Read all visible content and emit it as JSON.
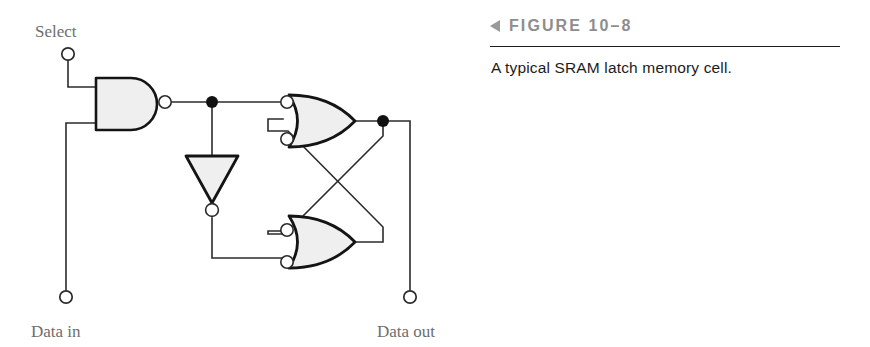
{
  "figure": {
    "marker_icon": "left-triangle-icon",
    "label": "FIGURE 10–8",
    "caption": "A typical SRAM latch memory cell."
  },
  "circuit": {
    "title": "A typical SRAM latch memory cell",
    "labels": {
      "select": "Select",
      "data_in": "Data in",
      "data_out": "Data out"
    },
    "colors": {
      "wire": "#2b2b2b",
      "gate_outline": "#141414",
      "gate_fill": "#efefef",
      "terminal_stroke": "#2b2b2b",
      "terminal_fill": "#ffffff",
      "junction_fill": "#111111",
      "label_text": "#6e6e6e",
      "caption_text": "#1c1c1c",
      "figure_label_text": "#8d8d8d",
      "rule": "#1d1d1d",
      "background": "#ffffff"
    },
    "terminals": [
      {
        "name": "select-terminal",
        "label": "Select",
        "x": 68,
        "y": 52
      },
      {
        "name": "data-in-terminal",
        "label": "Data in",
        "x": 66,
        "y": 298
      },
      {
        "name": "data-out-terminal",
        "label": "Data out",
        "x": 410,
        "y": 298
      }
    ],
    "gates": [
      {
        "name": "nand-gate",
        "type": "NAND",
        "inputs": 2,
        "x": 96,
        "y": 80,
        "width": 68,
        "height": 50
      },
      {
        "name": "inverter-gate",
        "type": "INVERTER",
        "inputs": 1,
        "x": 186,
        "y": 155,
        "width": 52,
        "height": 48,
        "orientation": "down"
      },
      {
        "name": "negative-and-gate-top",
        "type": "negative-AND",
        "inputs": 2,
        "x": 283,
        "y": 93,
        "width": 72,
        "height": 52
      },
      {
        "name": "negative-and-gate-bottom",
        "type": "negative-AND",
        "inputs": 2,
        "x": 283,
        "y": 215,
        "width": 72,
        "height": 52
      }
    ],
    "junctions": [
      {
        "name": "nand-output-node",
        "x": 212,
        "y": 102
      },
      {
        "name": "latch-output-node",
        "x": 383,
        "y": 121
      }
    ]
  }
}
